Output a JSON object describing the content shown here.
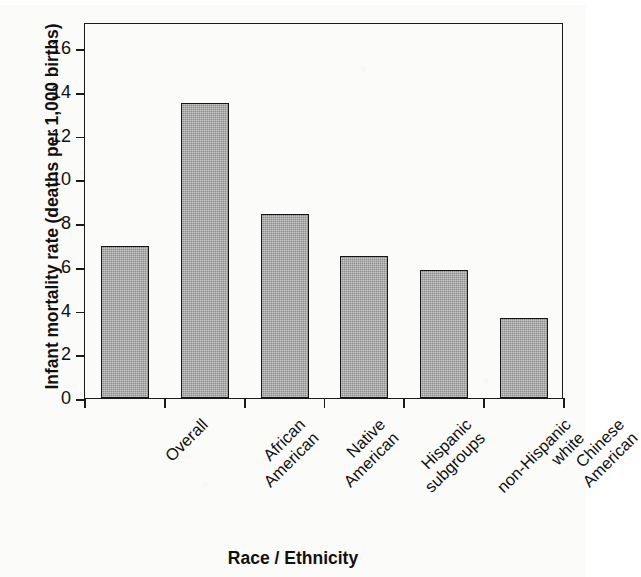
{
  "chart_data": {
    "type": "bar",
    "title": "",
    "xlabel": "Race / Ethnicity",
    "ylabel": "Infant mortality rate (deaths per 1,000 births)",
    "categories": [
      "Overall",
      "African American",
      "Native American",
      "Hispanic subgroups",
      "non-Hispanic white",
      "Chinese American"
    ],
    "category_lines": [
      [
        "Overall",
        ""
      ],
      [
        "African",
        "American"
      ],
      [
        "Native",
        "American"
      ],
      [
        "Hispanic",
        "subgroups"
      ],
      [
        "non-Hispanic",
        "white"
      ],
      [
        "Chinese",
        "American"
      ]
    ],
    "values": [
      6.95,
      13.5,
      8.4,
      6.5,
      5.85,
      3.65
    ],
    "ylim": [
      0,
      17.2
    ],
    "yticks": [
      0,
      2,
      4,
      6,
      8,
      10,
      12,
      14,
      16
    ],
    "ytick_labels": [
      "0",
      "2",
      "4",
      "6",
      "8",
      "10",
      "12",
      "14",
      "16"
    ],
    "grid": false,
    "legend": null,
    "bar_color": "#8e8e8e",
    "bar_edge_color": "#151515",
    "axis_color": "#1a1a1a",
    "label_rotation_deg": -45
  },
  "figure": {
    "background": "#fbfbfa"
  }
}
